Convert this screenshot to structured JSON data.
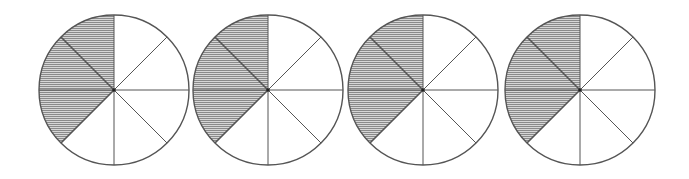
{
  "figure": {
    "description": "Four identical circles, each divided into 8 equal sectors, with 3 sectors shaded",
    "stroke_color": "#555555",
    "shade_color": "#8a8a8a",
    "background": "#ffffff",
    "radius": 75,
    "sectors_per_circle": 8,
    "circles": [
      {
        "id": "circle-1",
        "cx": 114,
        "cy": 90,
        "shaded_sectors": [
          0,
          1,
          2
        ]
      },
      {
        "id": "circle-2",
        "cx": 268,
        "cy": 90,
        "shaded_sectors": [
          0,
          1,
          2
        ]
      },
      {
        "id": "circle-3",
        "cx": 423,
        "cy": 90,
        "shaded_sectors": [
          0,
          1,
          2
        ]
      },
      {
        "id": "circle-4",
        "cx": 580,
        "cy": 90,
        "shaded_sectors": [
          0,
          1,
          2
        ]
      }
    ],
    "shaded_fraction_per_circle": "3/8"
  }
}
